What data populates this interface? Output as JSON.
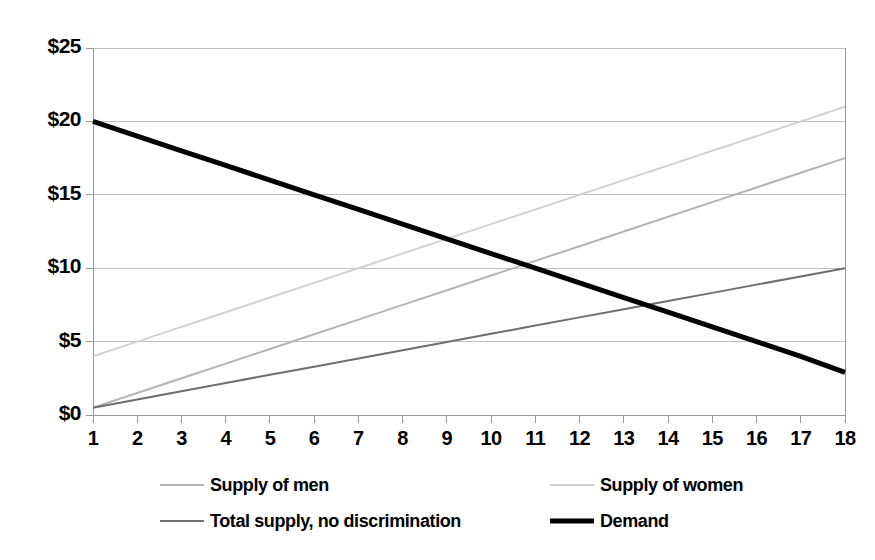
{
  "chart_data": {
    "type": "line",
    "title": "",
    "xlabel": "",
    "ylabel": "",
    "xlim": [
      1,
      18
    ],
    "ylim": [
      0,
      25
    ],
    "grid": true,
    "legend_position": "bottom",
    "x": [
      1,
      2,
      3,
      4,
      5,
      6,
      7,
      8,
      9,
      10,
      11,
      12,
      13,
      14,
      15,
      16,
      17,
      18
    ],
    "x_tick_labels": [
      "1",
      "2",
      "3",
      "4",
      "5",
      "6",
      "7",
      "8",
      "9",
      "10",
      "11",
      "12",
      "13",
      "14",
      "15",
      "16",
      "17",
      "18"
    ],
    "y_ticks": [
      0,
      5,
      10,
      15,
      20,
      25
    ],
    "y_tick_labels": [
      "$0",
      "$5",
      "$10",
      "$15",
      "$20",
      "$25"
    ],
    "series": [
      {
        "name": "Supply of men",
        "color": "#b4b4b4",
        "width": 2,
        "values": [
          0.5,
          1.5,
          2.5,
          3.5,
          4.5,
          5.5,
          6.5,
          7.5,
          8.5,
          9.5,
          10.5,
          11.5,
          12.5,
          13.5,
          14.5,
          15.5,
          16.5,
          17.5
        ]
      },
      {
        "name": "Supply of women",
        "color": "#d2d2d2",
        "width": 2,
        "values": [
          4.0,
          5.0,
          6.0,
          7.0,
          8.0,
          9.0,
          10.0,
          11.0,
          12.0,
          13.0,
          14.0,
          15.0,
          16.0,
          17.0,
          18.0,
          19.0,
          20.0,
          21.0
        ]
      },
      {
        "name": "Total supply, no discrimination",
        "color": "#6e6e6e",
        "width": 2,
        "values": [
          0.5,
          1.06,
          1.62,
          2.18,
          2.74,
          3.29,
          3.85,
          4.41,
          4.97,
          5.53,
          6.09,
          6.65,
          7.21,
          7.76,
          8.32,
          8.88,
          9.44,
          10.0
        ]
      },
      {
        "name": "Demand",
        "color": "#000000",
        "width": 5,
        "values": [
          20.0,
          19.0,
          18.0,
          17.0,
          16.0,
          15.0,
          14.0,
          13.0,
          12.0,
          11.0,
          10.0,
          9.0,
          8.0,
          7.0,
          6.0,
          5.0,
          4.0,
          2.9
        ]
      }
    ]
  },
  "legend": {
    "items": [
      {
        "label": "Supply of men",
        "color": "#b4b4b4",
        "width": 2,
        "row": 0,
        "col": 0
      },
      {
        "label": "Supply of women",
        "color": "#d2d2d2",
        "width": 2,
        "row": 0,
        "col": 1
      },
      {
        "label": "Total supply, no discrimination",
        "color": "#6e6e6e",
        "width": 2,
        "row": 1,
        "col": 0
      },
      {
        "label": "Demand",
        "color": "#000000",
        "width": 5,
        "row": 1,
        "col": 1
      }
    ]
  },
  "axes": {
    "axis_color": "#999999",
    "grid_color": "#bfbfbf",
    "plot_left": 93,
    "plot_right": 845,
    "plot_top": 48,
    "plot_bottom": 415
  }
}
